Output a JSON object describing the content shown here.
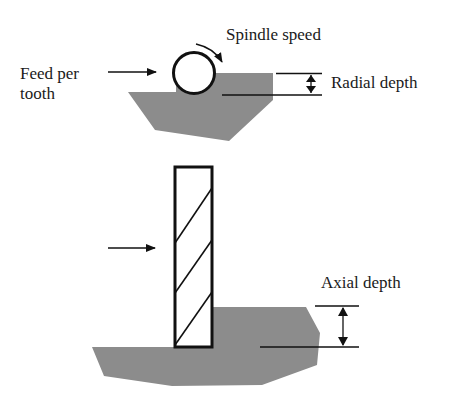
{
  "diagram": {
    "colors": {
      "workpiece": "#8c8c8c",
      "line": "#111111",
      "background": "#ffffff"
    },
    "top_view": {
      "labels": {
        "feed_line1": "Feed per",
        "feed_line2": "tooth",
        "spindle_speed": "Spindle speed",
        "radial_depth": "Radial depth"
      }
    },
    "side_view": {
      "labels": {
        "axial_depth": "Axial depth"
      }
    }
  }
}
